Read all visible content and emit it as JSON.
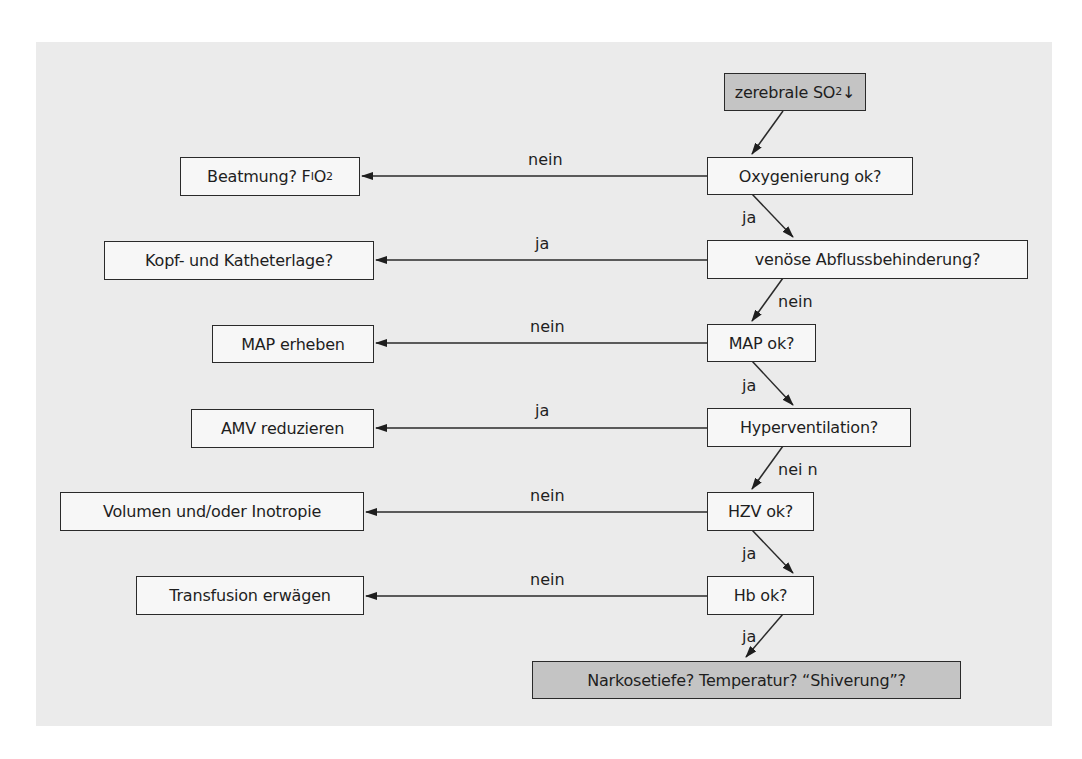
{
  "diagram": {
    "type": "flowchart",
    "language": "de",
    "start": {
      "label": "zerebrale SO",
      "sub": "2",
      "suffix": " ↓"
    },
    "decisions": [
      {
        "id": "oxygenierung",
        "label": "Oxygenierung ok?"
      },
      {
        "id": "venoese",
        "label": "venöse Abflussbehinderung?"
      },
      {
        "id": "map",
        "label": "MAP ok?"
      },
      {
        "id": "hyperventilation",
        "label": "Hyperventilation?"
      },
      {
        "id": "hzv",
        "label": "HZV ok?"
      },
      {
        "id": "hb",
        "label": "Hb ok?"
      }
    ],
    "actions": [
      {
        "id": "beatmung",
        "label": "Beatmung?  F",
        "sub": "I",
        "suffix": "O",
        "sub2": "2"
      },
      {
        "id": "kopf",
        "label": "Kopf- und Katheterlage?"
      },
      {
        "id": "map_erheben",
        "label": "MAP erheben"
      },
      {
        "id": "amv",
        "label": "AMV reduzieren"
      },
      {
        "id": "volumen",
        "label": "Volumen und/oder Inotropie"
      },
      {
        "id": "transfusion",
        "label": "Transfusion erwägen"
      }
    ],
    "end": {
      "label": "Narkosetiefe? Temperatur? “Shiverung”?"
    },
    "edge_labels": {
      "oxy_to_beatmung": "nein",
      "oxy_to_venoese": "ja",
      "venoese_to_kopf": "ja",
      "venoese_to_map": "nein",
      "map_to_erheben": "nein",
      "map_to_hyper": "ja",
      "hyper_to_amv": "ja",
      "hyper_to_hzv": "nei n",
      "hzv_to_volumen": "nein",
      "hzv_to_hb": "ja",
      "hb_to_transfusion": "nein",
      "hb_to_end": "ja"
    },
    "colors": {
      "panel": "#ebebeb",
      "box_fill": "#f7f7f7",
      "highlight_fill": "#c4c4c4",
      "stroke": "#2a2a2a"
    }
  }
}
